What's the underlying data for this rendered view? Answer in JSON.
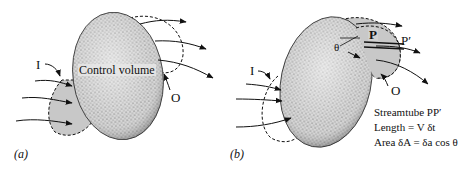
{
  "figure": {
    "panels": [
      {
        "id": "a",
        "label": "(a)",
        "control_volume_label": "Control volume",
        "inlet_label": "I",
        "outlet_label": "O"
      },
      {
        "id": "b",
        "label": "(b)",
        "inlet_label": "I",
        "outlet_label": "O",
        "point_P": "P",
        "point_P_prime": "P′",
        "angle_label": "θ",
        "caption": [
          "Streamtube PP′",
          "Length = V δt",
          "Area δA = δa cos θ"
        ]
      }
    ],
    "colors": {
      "ink": "#111111",
      "stipple_fill": "#bdbdbd",
      "shaded_region": "#c8c8c8",
      "background": "#ffffff"
    }
  }
}
